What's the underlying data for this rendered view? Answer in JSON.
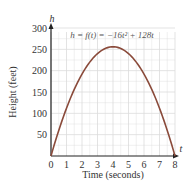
{
  "chart_data": {
    "type": "line",
    "title": "",
    "annotation": "h = f(t) = −16t² + 128t",
    "xlabel": "Time (seconds)",
    "ylabel": "Height (feet)",
    "x_axis_var": "t",
    "y_axis_var": "h",
    "xlim": [
      0,
      8
    ],
    "ylim": [
      0,
      300
    ],
    "x_ticks": [
      0,
      1,
      2,
      3,
      4,
      5,
      6,
      7,
      8
    ],
    "y_ticks": [
      50,
      100,
      150,
      200,
      250,
      300
    ],
    "grid": true,
    "legend": "none",
    "series": [
      {
        "name": "h = f(t) = −16t² + 128t",
        "x": [
          0,
          0.5,
          1,
          1.5,
          2,
          2.5,
          3,
          3.5,
          4,
          4.5,
          5,
          5.5,
          6,
          6.5,
          7,
          7.5,
          8
        ],
        "values": [
          0,
          60,
          112,
          156,
          192,
          220,
          240,
          252,
          256,
          252,
          240,
          220,
          192,
          156,
          112,
          60,
          0
        ]
      }
    ],
    "colors": {
      "curve": "#8a4a3a",
      "axis": "#222222",
      "grid": "#dcdcdc"
    }
  }
}
